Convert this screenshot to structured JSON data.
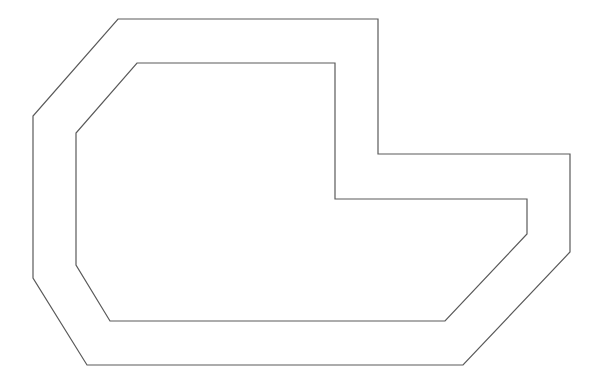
{
  "canvas": {
    "width": 607,
    "height": 392,
    "background": "#ffffff"
  },
  "style": {
    "stroke": "#5a5a5a",
    "stroke_width": 1.2
  },
  "shapes": {
    "outer_outline": {
      "points": "118,19 378,19 378,154 570,154 570,252 463,365 87,365 33,278 33,116"
    },
    "inner_outline": {
      "points": "137,63 335,63 335,199 527,199 527,234 445,321 110,321 76,265 76,133"
    }
  }
}
